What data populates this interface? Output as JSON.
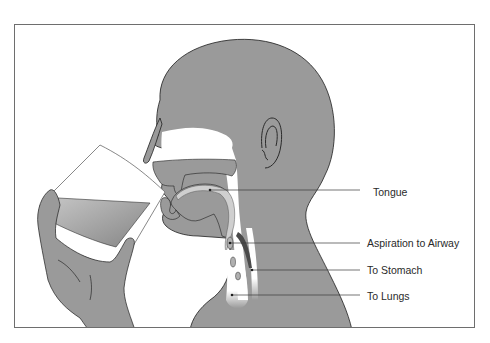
{
  "figure": {
    "colors": {
      "skin": "#9a9a9a",
      "outline": "#1e1e1e",
      "frame": "#6e6e6e",
      "passage": "#ffffff",
      "liquid_top": "#b8b8b8",
      "liquid_bottom": "#8c8c8c",
      "text": "#2a2a2a"
    },
    "labels": [
      {
        "id": "tongue",
        "text": "Tongue"
      },
      {
        "id": "aspiration",
        "text": "Aspiration to Airway"
      },
      {
        "id": "stomach",
        "text": "To Stomach"
      },
      {
        "id": "lungs",
        "text": "To Lungs"
      }
    ]
  }
}
